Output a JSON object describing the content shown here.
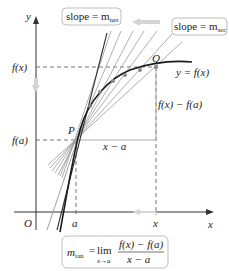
{
  "diagram": {
    "axes": {
      "x_label": "x",
      "y_label": "y",
      "origin_label": "O"
    },
    "point_labels": {
      "P": "P",
      "Q": "Q"
    },
    "tick_labels": {
      "x_a": "a",
      "x_x": "x",
      "y_fx": "f(x)",
      "y_fa": "f(a)"
    },
    "curve_label": "y = f(x)",
    "rise_label": "f(x) − f(a)",
    "run_label": "x − a",
    "slope_tan_box": {
      "text": "slope = m",
      "sub": "tan"
    },
    "slope_sec_box": {
      "text": "slope = m",
      "sub": "sec"
    },
    "formula_box": {
      "m": "m",
      "m_sub": "tan",
      "eq": "=",
      "lim": "lim",
      "lim_sub": "x→a",
      "numerator": "f(x) − f(a)",
      "denominator": "x − a"
    },
    "colors": {
      "curve": "#1a1a1a",
      "secant": "#9a9a9a",
      "tangent": "#333333",
      "arrow": "#d0d0d0",
      "point": "#8a8a8a",
      "box_border": "#bdbdbd"
    }
  }
}
